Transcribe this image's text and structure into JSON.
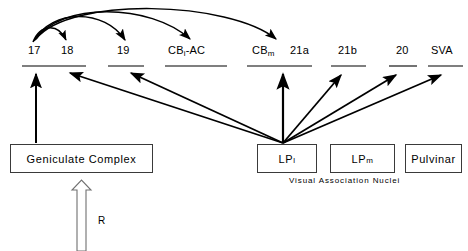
{
  "figure": {
    "background_color": "#ffffff",
    "line_color": "#000000",
    "box_border_color": "#3a3a3a"
  },
  "cortical_areas": [
    {
      "id": "a17",
      "label": "17",
      "sub": "",
      "x": 28,
      "y": 55
    },
    {
      "id": "a18",
      "label": "18",
      "sub": "",
      "x": 61,
      "y": 55
    },
    {
      "id": "a19",
      "label": "19",
      "sub": "",
      "x": 117,
      "y": 55
    },
    {
      "id": "cbi_ac",
      "label": "CB",
      "sub": "i",
      "suffix": "-AC",
      "x": 171,
      "y": 55
    },
    {
      "id": "cbm",
      "label": "CB",
      "sub": "m",
      "suffix": "",
      "x": 252,
      "y": 55
    },
    {
      "id": "a21a",
      "label": "21a",
      "sub": "",
      "x": 291,
      "y": 55
    },
    {
      "id": "a21b",
      "label": "21b",
      "sub": "",
      "x": 340,
      "y": 55
    },
    {
      "id": "a20",
      "label": "20",
      "sub": "",
      "x": 398,
      "y": 55
    },
    {
      "id": "sva",
      "label": "SVA",
      "sub": "",
      "x": 436,
      "y": 55
    }
  ],
  "cortical_underlines": [
    {
      "id": "underline-17-18",
      "x1": 22,
      "x2": 86,
      "y": 66
    },
    {
      "id": "underline-19",
      "x1": 108,
      "x2": 144,
      "y": 66
    },
    {
      "id": "underline-cbi-ac",
      "x1": 165,
      "x2": 227,
      "y": 66
    },
    {
      "id": "underline-cbm-21a",
      "x1": 247,
      "x2": 312,
      "y": 66
    },
    {
      "id": "underline-21b",
      "x1": 331,
      "x2": 366,
      "y": 66
    },
    {
      "id": "underline-20",
      "x1": 389,
      "x2": 417,
      "y": 66
    },
    {
      "id": "underline-sva",
      "x1": 428,
      "x2": 463,
      "y": 66
    }
  ],
  "nuclei_boxes": [
    {
      "id": "geniculate",
      "label": "Geniculate Complex",
      "sub": "",
      "x": 10,
      "y": 144,
      "w": 143,
      "h": 29
    },
    {
      "id": "lp_l",
      "label": "LP",
      "sub": "l",
      "x": 257,
      "y": 144,
      "w": 60,
      "h": 29
    },
    {
      "id": "lp_m",
      "label": "LP",
      "sub": "m",
      "x": 330,
      "y": 144,
      "w": 65,
      "h": 29
    },
    {
      "id": "pulvinar",
      "label": "Pulvinar",
      "sub": "",
      "x": 405,
      "y": 144,
      "w": 57,
      "h": 29
    }
  ],
  "caption": {
    "text": "Visual  Association  Nuclei",
    "x": 289,
    "y": 176
  },
  "retina_input": {
    "label": "R",
    "label_x": 98,
    "label_y": 222,
    "arrow_x": 81,
    "arrow_top": 184,
    "arrow_bottom": 251,
    "style": "hollow-outline-arrow"
  },
  "connections": {
    "corticocortical_arcs": [
      {
        "id": "arc-17-to-18",
        "from": "17",
        "to": "18"
      },
      {
        "id": "arc-17-to-19",
        "from": "17",
        "to": "19"
      },
      {
        "id": "arc-17-to-cbi-ac",
        "from": "17",
        "to": "CBi-AC"
      },
      {
        "id": "arc-17-to-cbm",
        "from": "17",
        "to": "CBm"
      }
    ],
    "thalamocortical": [
      {
        "id": "arrow-geniculate-to-17",
        "from": "Geniculate Complex",
        "to": "17"
      },
      {
        "id": "arrow-lpl-to-18",
        "from": "LPl",
        "to": "18"
      },
      {
        "id": "arrow-lpl-to-19",
        "from": "LPl",
        "to": "19"
      },
      {
        "id": "arrow-lpl-to-cbm",
        "from": "LPl",
        "to": "CBm"
      },
      {
        "id": "arrow-lpl-to-21b",
        "from": "LPl",
        "to": "21b"
      },
      {
        "id": "arrow-lpl-to-20",
        "from": "LPl",
        "to": "20"
      },
      {
        "id": "arrow-lpl-to-sva",
        "from": "LPl",
        "to": "SVA"
      }
    ],
    "retinal": [
      {
        "id": "arrow-retina-to-geniculate",
        "from": "R",
        "to": "Geniculate Complex"
      }
    ]
  }
}
